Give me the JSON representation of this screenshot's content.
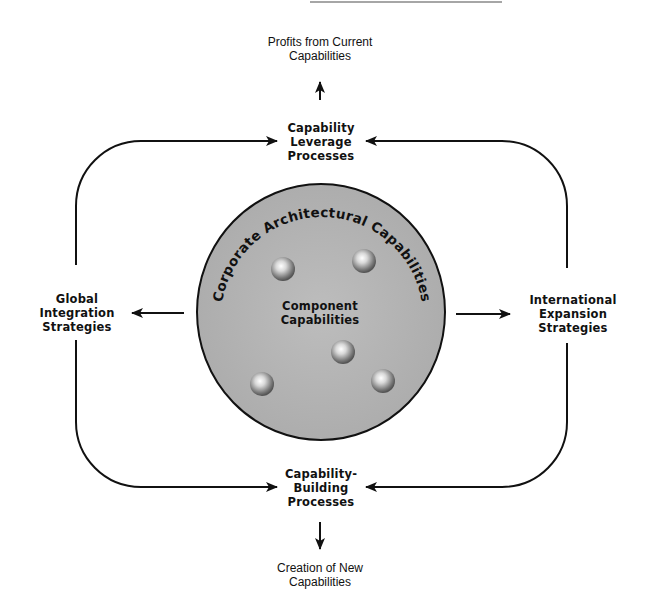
{
  "top_outcome": {
    "lines": [
      "Profits from Current",
      "Capabilities"
    ]
  },
  "top_process": {
    "lines": [
      "Capability",
      "Leverage",
      "Processes"
    ]
  },
  "left_strategy": {
    "lines": [
      "Global",
      "Integration",
      "Strategies"
    ]
  },
  "right_strategy": {
    "lines": [
      "International",
      "Expansion",
      "Strategies"
    ]
  },
  "bottom_process": {
    "lines": [
      "Capability-",
      "Building",
      "Processes"
    ]
  },
  "bottom_outcome": {
    "lines": [
      "Creation of New",
      "Capabilities"
    ]
  },
  "circle": {
    "arc_label": "Corporate Architectural Capabilities",
    "center_label": {
      "lines": [
        "Component",
        "Capabilities"
      ]
    },
    "fill_color": "#b4b4b4",
    "component_count": 5
  },
  "colors": {
    "line": "#111111",
    "text": "#111111",
    "background": "#ffffff"
  }
}
